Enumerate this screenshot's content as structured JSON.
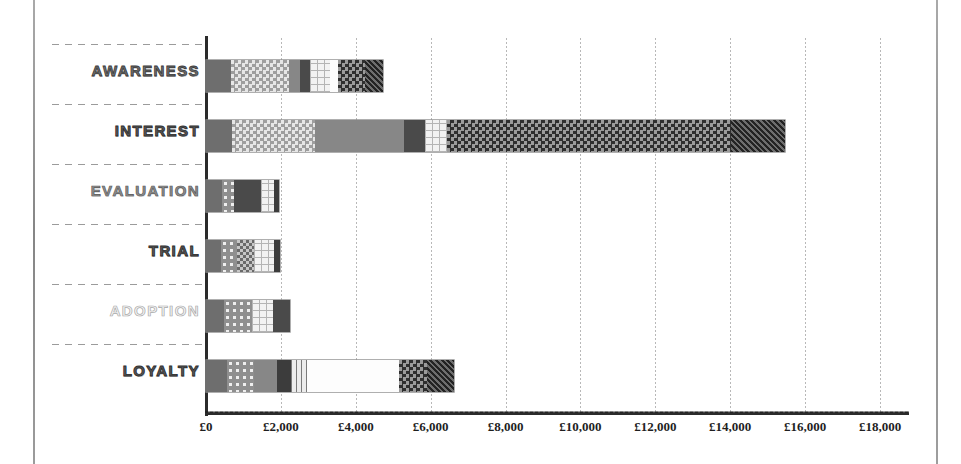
{
  "chart_data": {
    "type": "bar",
    "orientation": "horizontal",
    "stacked": true,
    "title": "",
    "xlabel": "",
    "ylabel": "",
    "xlim": [
      0,
      18000
    ],
    "xtick_step": 2000,
    "grid": true,
    "legend": "none",
    "currency_symbol": "£",
    "categories": [
      "AWARENESS",
      "INTEREST",
      "EVALUATION",
      "TRIAL",
      "ADOPTION",
      "LOYALTY"
    ],
    "tick_labels": [
      "£0",
      "£2,000",
      "£4,000",
      "£6,000",
      "£8,000",
      "£10,000",
      "£12,000",
      "£14,000",
      "£16,000",
      "£18,000"
    ],
    "tick_values": [
      0,
      2000,
      4000,
      6000,
      8000,
      10000,
      12000,
      14000,
      16000,
      18000
    ],
    "series": [
      {
        "name": "Segment 1",
        "pattern": "solid-dark",
        "values": [
          670,
          690,
          420,
          410,
          480,
          560
        ]
      },
      {
        "name": "Segment 2",
        "pattern": "check-light",
        "values": [
          1560,
          2230,
          330,
          410,
          740,
          730
        ]
      },
      {
        "name": "Segment 3",
        "pattern": "solid-mid",
        "values": [
          270,
          2380,
          120,
          160,
          0,
          620
        ]
      },
      {
        "name": "Segment 4",
        "pattern": "solid-darker",
        "values": [
          270,
          540,
          720,
          450,
          450,
          370
        ]
      },
      {
        "name": "Segment 5",
        "pattern": "grid-light",
        "values": [
          540,
          610,
          350,
          540,
          580,
          420
        ]
      },
      {
        "name": "Segment 6",
        "pattern": "white",
        "values": [
          220,
          0,
          0,
          0,
          0,
          2450
        ]
      },
      {
        "name": "Segment 7",
        "pattern": "check-dark",
        "values": [
          730,
          7560,
          0,
          0,
          0,
          760
        ]
      },
      {
        "name": "Segment 8",
        "pattern": "fine-dark",
        "values": [
          480,
          1460,
          0,
          0,
          0,
          720
        ]
      }
    ],
    "totals": [
      4740,
      15470,
      1940,
      1970,
      2250,
      6630
    ],
    "bars": [
      {
        "category": "AWARENESS",
        "total": 4740,
        "segments": [
          {
            "pattern": "solid-dark",
            "value": 670
          },
          {
            "pattern": "check-light",
            "value": 1560
          },
          {
            "pattern": "solid-mid",
            "value": 270
          },
          {
            "pattern": "solid-darker",
            "value": 270
          },
          {
            "pattern": "grid-light",
            "value": 540
          },
          {
            "pattern": "white",
            "value": 220
          },
          {
            "pattern": "check-dark",
            "value": 730
          },
          {
            "pattern": "fine-dark",
            "value": 480
          }
        ]
      },
      {
        "category": "INTEREST",
        "total": 15470,
        "segments": [
          {
            "pattern": "solid-dark",
            "value": 690
          },
          {
            "pattern": "check-light",
            "value": 2230
          },
          {
            "pattern": "solid-mid",
            "value": 2380
          },
          {
            "pattern": "solid-darker",
            "value": 540
          },
          {
            "pattern": "grid-light",
            "value": 610
          },
          {
            "pattern": "check-dark",
            "value": 7560
          },
          {
            "pattern": "fine-dark",
            "value": 1460
          }
        ]
      },
      {
        "category": "EVALUATION",
        "total": 1940,
        "segments": [
          {
            "pattern": "solid-dark",
            "value": 420
          },
          {
            "pattern": "dots",
            "value": 330
          },
          {
            "pattern": "solid-darker",
            "value": 720
          },
          {
            "pattern": "grid-light",
            "value": 350
          },
          {
            "pattern": "solid-deep",
            "value": 120
          }
        ]
      },
      {
        "category": "TRIAL",
        "total": 1970,
        "segments": [
          {
            "pattern": "solid-dark",
            "value": 410
          },
          {
            "pattern": "dots",
            "value": 410
          },
          {
            "pattern": "check-mid",
            "value": 450
          },
          {
            "pattern": "grid-light",
            "value": 540
          },
          {
            "pattern": "solid-deep",
            "value": 160
          }
        ]
      },
      {
        "category": "ADOPTION",
        "total": 2250,
        "segments": [
          {
            "pattern": "solid-dark",
            "value": 480
          },
          {
            "pattern": "dots",
            "value": 740
          },
          {
            "pattern": "grid-light",
            "value": 580
          },
          {
            "pattern": "solid-darker",
            "value": 450
          }
        ]
      },
      {
        "category": "LOYALTY",
        "total": 6630,
        "segments": [
          {
            "pattern": "solid-dark",
            "value": 560
          },
          {
            "pattern": "dots",
            "value": 730
          },
          {
            "pattern": "solid-mid",
            "value": 620
          },
          {
            "pattern": "solid-deep",
            "value": 370
          },
          {
            "pattern": "vstripe",
            "value": 420
          },
          {
            "pattern": "white",
            "value": 2450
          },
          {
            "pattern": "check-dark",
            "value": 760
          },
          {
            "pattern": "fine-dark",
            "value": 720
          }
        ]
      }
    ]
  },
  "labels": {
    "awareness": "AWARENESS",
    "interest": "INTEREST",
    "evaluation": "EVALUATION",
    "trial": "TRIAL",
    "adoption": "ADOPTION",
    "loyalty": "LOYALTY"
  },
  "ticks": {
    "t0": "£0",
    "t1": "£2,000",
    "t2": "£4,000",
    "t3": "£6,000",
    "t4": "£8,000",
    "t5": "£10,000",
    "t6": "£12,000",
    "t7": "£14,000",
    "t8": "£16,000",
    "t9": "£18,000"
  },
  "colors": {
    "axis": "#2b2b2b",
    "grid": "#b8b8b8",
    "label_dark": "#6f6f6f",
    "label_light": "#f4f4f4",
    "background": "#ffffff"
  }
}
